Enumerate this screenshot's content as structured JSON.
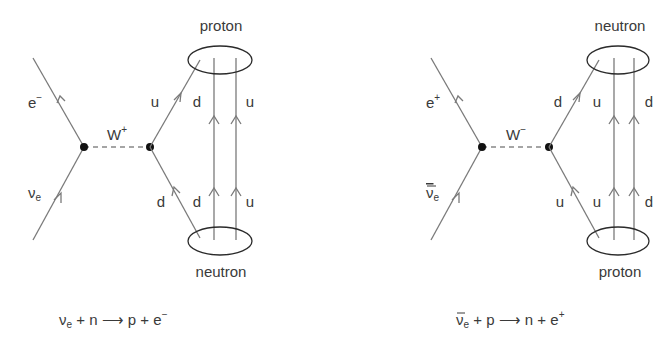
{
  "diagrams": [
    {
      "name": "beta-minus-induced",
      "incoming_lepton": {
        "base": "ν",
        "sub": "e",
        "bar": false
      },
      "outgoing_lepton": {
        "base": "e",
        "sup": "−"
      },
      "boson": {
        "base": "W",
        "sup": "+"
      },
      "top_hadron": "proton",
      "bottom_hadron": "neutron",
      "vertex_quark_out": "u",
      "vertex_quark_in": "d",
      "spectator_top": [
        "d",
        "u"
      ],
      "spectator_bottom": [
        "d",
        "u"
      ],
      "equation": {
        "lhs_base": "ν",
        "lhs_sub": "e",
        "lhs_bar": false,
        "lhs_rest": " + n ",
        "arrow": "⟶",
        "rhs": " p + e",
        "rhs_sup": "−"
      }
    },
    {
      "name": "beta-plus-induced",
      "incoming_lepton": {
        "base": "ν",
        "sub": "e",
        "bar": true
      },
      "outgoing_lepton": {
        "base": "e",
        "sup": "+"
      },
      "boson": {
        "base": "W",
        "sup": "−"
      },
      "top_hadron": "neutron",
      "bottom_hadron": "proton",
      "vertex_quark_out": "d",
      "vertex_quark_in": "u",
      "spectator_top": [
        "u",
        "d"
      ],
      "spectator_bottom": [
        "u",
        "d"
      ],
      "equation": {
        "lhs_base": "ν",
        "lhs_sub": "e",
        "lhs_bar": true,
        "lhs_rest": " + p ",
        "arrow": "⟶",
        "rhs": " n + e",
        "rhs_sup": "+"
      }
    }
  ]
}
